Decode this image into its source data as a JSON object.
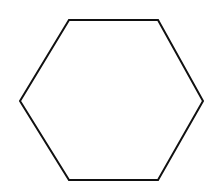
{
  "diagram": {
    "shape": "hexagon",
    "stroke_color": "#111111",
    "fill_color": "#ffffff",
    "stroke_width": 2,
    "vertices": [
      [
        69,
        20
      ],
      [
        158,
        20
      ],
      [
        203,
        101
      ],
      [
        158,
        180
      ],
      [
        69,
        180
      ],
      [
        20,
        101
      ]
    ]
  }
}
